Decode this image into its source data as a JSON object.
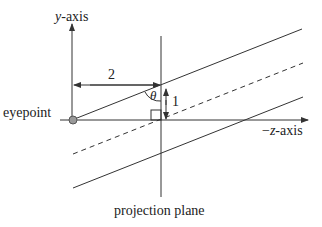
{
  "diagram": {
    "labels": {
      "y_axis": "y-axis",
      "y_axis_var": "y",
      "y_axis_suffix": "-axis",
      "z_axis": "−z-axis",
      "z_axis_prefix": "−",
      "z_axis_var": "z",
      "z_axis_suffix": "-axis",
      "eyepoint": "eyepoint",
      "projection_plane": "projection plane",
      "distance": "2",
      "height": "1",
      "angle": "θ"
    },
    "colors": {
      "line": "#333333",
      "eyepoint_fill": "#999999"
    }
  }
}
